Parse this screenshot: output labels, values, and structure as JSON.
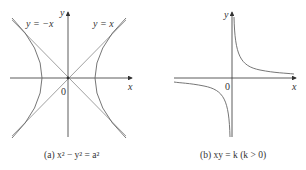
{
  "figure_a": {
    "caption": "(a) x² − y² = a²",
    "x_label": "x",
    "y_label": "y",
    "origin_label": "0",
    "asymptote_left_label": "y = −x",
    "asymptote_right_label": "y = x"
  },
  "figure_b": {
    "caption": "(b) xy = k  (k > 0)",
    "x_label": "x",
    "y_label": "y",
    "origin_label": "0"
  },
  "colors": {
    "curve": "#666666",
    "axis": "#333333"
  }
}
